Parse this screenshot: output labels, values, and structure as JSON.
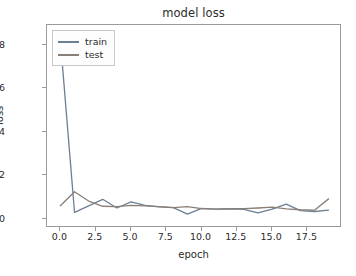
{
  "chart_data": {
    "type": "line",
    "title": "model loss",
    "xlabel": "epoch",
    "ylabel": "loss",
    "xlim": [
      -0.95,
      19.95
    ],
    "ylim": [
      -0.42,
      8.92
    ],
    "grid": false,
    "legend_position": "upper left",
    "xticks": [
      "0.0",
      "2.5",
      "5.0",
      "7.5",
      "10.0",
      "12.5",
      "15.0",
      "17.5"
    ],
    "xtick_values": [
      0.0,
      2.5,
      5.0,
      7.5,
      10.0,
      12.5,
      15.0,
      17.5
    ],
    "yticks": [
      "0",
      "2",
      "4",
      "6",
      "8"
    ],
    "ytick_values": [
      0,
      2,
      4,
      6,
      8
    ],
    "x": [
      0,
      1,
      2,
      3,
      4,
      5,
      6,
      7,
      8,
      9,
      10,
      11,
      12,
      13,
      14,
      15,
      16,
      17,
      18,
      19
    ],
    "series": [
      {
        "name": "train",
        "color": "#6e7f95",
        "values": [
          8.2,
          0.3,
          0.6,
          0.9,
          0.5,
          0.78,
          0.62,
          0.55,
          0.52,
          0.22,
          0.48,
          0.45,
          0.46,
          0.44,
          0.28,
          0.45,
          0.68,
          0.38,
          0.34,
          0.4
        ]
      },
      {
        "name": "test",
        "color": "#8a7f76",
        "values": [
          0.6,
          1.25,
          0.82,
          0.58,
          0.56,
          0.62,
          0.6,
          0.56,
          0.52,
          0.56,
          0.47,
          0.45,
          0.47,
          0.47,
          0.5,
          0.54,
          0.46,
          0.42,
          0.4,
          0.92
        ]
      }
    ]
  },
  "legend": {
    "entries": [
      {
        "label": "train"
      },
      {
        "label": "test"
      }
    ]
  }
}
